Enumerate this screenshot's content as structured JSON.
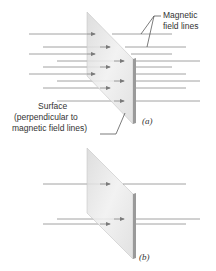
{
  "figure": {
    "panel_a": {
      "tag": "(a)",
      "label_field_lines": [
        "Magnetic",
        "field lines"
      ],
      "label_surface": [
        "Surface",
        "(perpendicular to",
        "magnetic field lines)"
      ],
      "field_line_count": 9,
      "orientation": "surface perpendicular to magnetic field lines"
    },
    "panel_b": {
      "tag": "(b)",
      "field_line_count": 3
    },
    "colors": {
      "field_line": "#8a8a8a",
      "arrow_head": "#7a7a7a",
      "plate_face": "#e6e6e6",
      "plate_edge": "#9a9a9a",
      "text": "#333333"
    }
  }
}
